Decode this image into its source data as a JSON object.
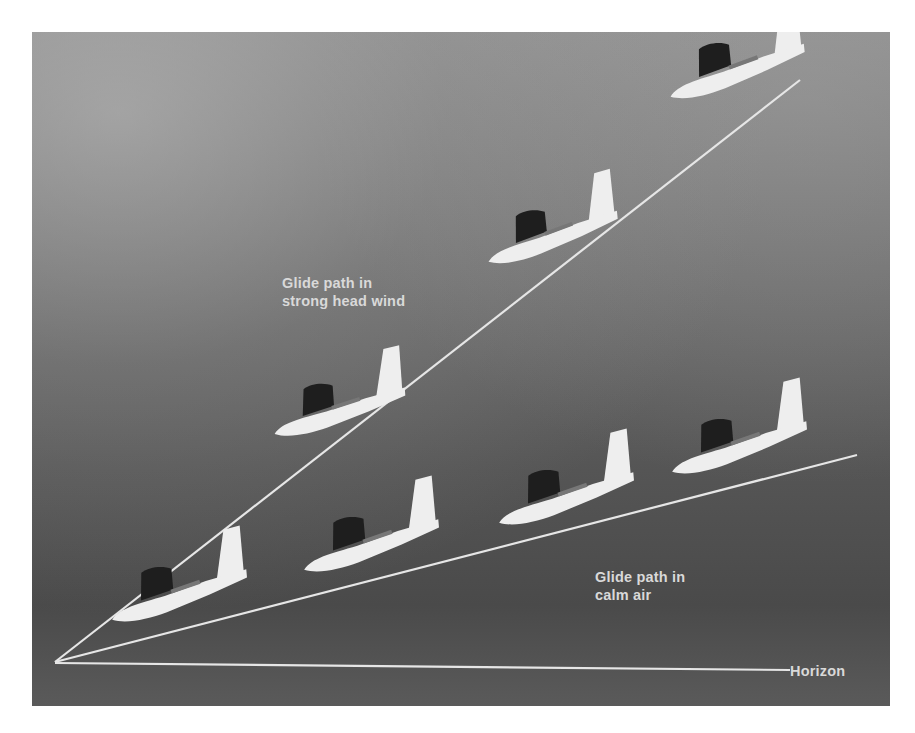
{
  "figure": {
    "labels": {
      "headwind": [
        "Glide path in",
        "strong head wind"
      ],
      "calm": [
        "Glide path in",
        "calm air"
      ],
      "horizon": "Horizon"
    },
    "colors": {
      "background_light": "#8d8d8d",
      "background_dark": "#4a4a4a",
      "line": "#e6e6e6",
      "aircraft": "#eeeeee",
      "canopy": "#1e1e1e",
      "text": "#d9d9d9"
    },
    "origin": {
      "x": 55,
      "y": 662
    },
    "lines": {
      "headwind_end": {
        "x": 800,
        "y": 80
      },
      "calm_end": {
        "x": 857,
        "y": 455
      },
      "horizon_end": {
        "x": 788,
        "y": 670
      }
    },
    "aircraft_icon": "glider-icon",
    "headwind_aircraft_count": 3,
    "calm_aircraft_count": 4
  }
}
